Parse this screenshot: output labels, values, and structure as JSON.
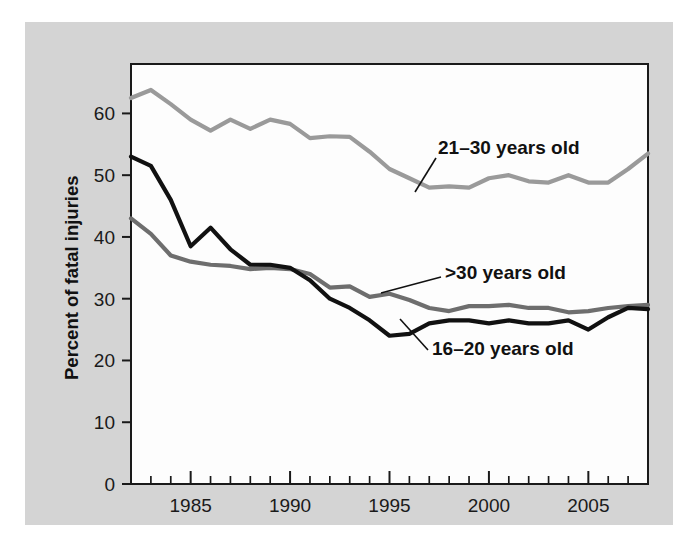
{
  "figure": {
    "background_color": "#ffffff",
    "panel_color": "#d4d4d4",
    "plot_background_color": "#fdfdfd",
    "frame_color": "#1a1a1a"
  },
  "axes": {
    "ylabel": "Percent of fatal injuries",
    "yticks": [
      0,
      10,
      20,
      30,
      40,
      50,
      60
    ],
    "ytick_labels": [
      "0",
      "10",
      "20",
      "30",
      "40",
      "50",
      "60"
    ],
    "xtick_labels": [
      "1985",
      "1990",
      "1995",
      "2000",
      "2005"
    ],
    "xticks_major": [
      1985,
      1990,
      1995,
      2000,
      2005
    ],
    "xlim": [
      1982,
      2008
    ],
    "ylim": [
      0,
      68
    ],
    "grid": false
  },
  "annotations": [
    {
      "name": "label-21-30",
      "text": "21–30 years old",
      "x": 438,
      "y": 154
    },
    {
      "name": "label-over-30",
      "text": ">30 years old",
      "x": 445,
      "y": 279
    },
    {
      "name": "label-16-20",
      "text": "16–20 years old",
      "x": 432,
      "y": 355
    }
  ],
  "chart_data": {
    "type": "line",
    "title": "",
    "xlabel": "",
    "ylabel": "Percent of fatal injuries",
    "xlim": [
      1982,
      2008
    ],
    "ylim": [
      0,
      68
    ],
    "grid": false,
    "legend_position": "inline-annotations",
    "x": [
      1982,
      1983,
      1984,
      1985,
      1986,
      1987,
      1988,
      1989,
      1990,
      1991,
      1992,
      1993,
      1994,
      1995,
      1996,
      1997,
      1998,
      1999,
      2000,
      2001,
      2002,
      2003,
      2004,
      2005,
      2006,
      2007,
      2008
    ],
    "series": [
      {
        "name": "21–30 years old",
        "color": "#9a9a9a",
        "values": [
          62.5,
          63.8,
          61.5,
          59.0,
          57.2,
          59.0,
          57.5,
          59.0,
          58.3,
          56.0,
          56.3,
          56.2,
          53.8,
          51.0,
          49.5,
          48.0,
          48.2,
          48.0,
          49.5,
          50.0,
          49.0,
          48.8,
          50.0,
          48.8,
          48.8,
          51.0,
          53.5
        ]
      },
      {
        "name": "16–20 years old",
        "color": "#111111",
        "values": [
          53.0,
          51.5,
          46.0,
          38.5,
          41.5,
          38.0,
          35.5,
          35.5,
          35.0,
          33.0,
          30.0,
          28.5,
          26.5,
          24.0,
          24.3,
          26.0,
          26.5,
          26.5,
          26.0,
          26.5,
          26.0,
          26.0,
          26.5,
          25.0,
          27.0,
          28.5,
          28.3
        ]
      },
      {
        "name": ">30 years old",
        "color": "#6e6e6e",
        "values": [
          43.0,
          40.5,
          37.0,
          36.0,
          35.5,
          35.3,
          34.8,
          35.0,
          34.8,
          34.0,
          31.8,
          32.0,
          30.3,
          30.8,
          29.8,
          28.5,
          28.0,
          28.8,
          28.8,
          29.0,
          28.5,
          28.5,
          27.8,
          28.0,
          28.5,
          28.8,
          29.0
        ]
      }
    ]
  }
}
